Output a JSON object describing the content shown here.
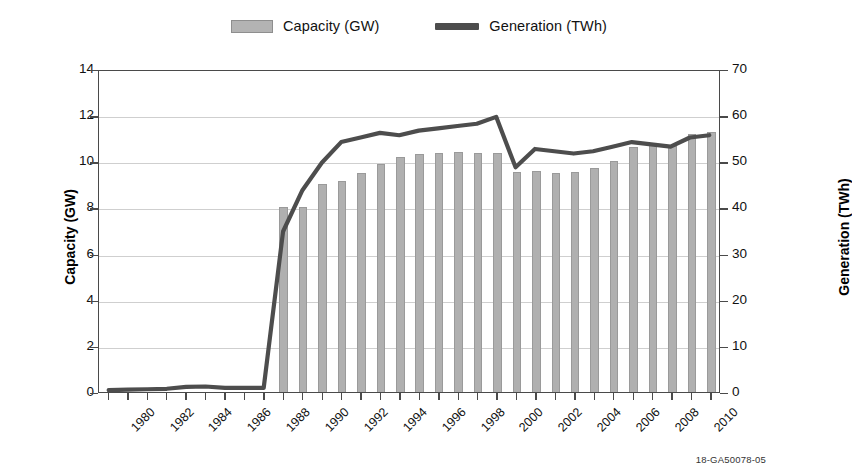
{
  "legend": {
    "position": "top-center",
    "items": [
      {
        "label": "Capacity (GW)",
        "marker": "bar-swatch-icon",
        "color": "#b0b0b0"
      },
      {
        "label": "Generation (TWh)",
        "marker": "line-swatch-icon",
        "color": "#4d4d4d"
      }
    ]
  },
  "caption": "18-GA50078-05",
  "chart_data": {
    "type": "bar",
    "title": "",
    "xlabel": "",
    "ylabel": "Capacity (GW)",
    "y2label": "Generation (TWh)",
    "ylim": [
      0,
      14
    ],
    "y2lim": [
      0,
      70
    ],
    "yticks": [
      0,
      2,
      4,
      6,
      8,
      10,
      12,
      14
    ],
    "y2ticks": [
      0,
      10,
      20,
      30,
      40,
      50,
      60,
      70
    ],
    "grid": true,
    "x": [
      1980,
      1981,
      1982,
      1983,
      1984,
      1985,
      1986,
      1987,
      1988,
      1989,
      1990,
      1991,
      1992,
      1993,
      1994,
      1995,
      1996,
      1997,
      1998,
      1999,
      2000,
      2001,
      2002,
      2003,
      2004,
      2005,
      2006,
      2007,
      2008,
      2009,
      2010,
      2011
    ],
    "xtick_labels": [
      "1980",
      "1982",
      "1984",
      "1986",
      "1988",
      "1990",
      "1992",
      "1994",
      "1996",
      "1998",
      "2000",
      "2002",
      "2004",
      "2006",
      "2008",
      "2010"
    ],
    "xtick_values": [
      1980,
      1982,
      1984,
      1986,
      1988,
      1990,
      1992,
      1994,
      1996,
      1998,
      2000,
      2002,
      2004,
      2006,
      2008,
      2010
    ],
    "series": [
      {
        "name": "Capacity (GW)",
        "type": "bar",
        "axis": "left",
        "color": "#b0b0b0",
        "values": [
          0,
          0,
          0,
          0,
          0,
          0,
          0,
          0,
          0,
          8.0,
          8.0,
          9.0,
          9.15,
          9.5,
          9.9,
          10.2,
          10.3,
          10.35,
          10.4,
          10.35,
          10.35,
          9.55,
          9.6,
          9.5,
          9.55,
          9.7,
          10.0,
          10.6,
          10.8,
          10.65,
          11.2,
          11.25
        ]
      },
      {
        "name": "Generation (TWh)",
        "type": "line",
        "axis": "right",
        "color": "#4d4d4d",
        "values": [
          0.4,
          0.5,
          0.6,
          0.7,
          1.1,
          1.2,
          0.9,
          0.9,
          0.9,
          35.0,
          44.0,
          50.0,
          54.5,
          55.5,
          56.5,
          56.0,
          57.0,
          57.5,
          58.0,
          58.5,
          60.0,
          49.0,
          53.0,
          52.5,
          52.0,
          52.5,
          53.5,
          54.5,
          54.0,
          53.5,
          55.5,
          56.0
        ]
      }
    ]
  }
}
